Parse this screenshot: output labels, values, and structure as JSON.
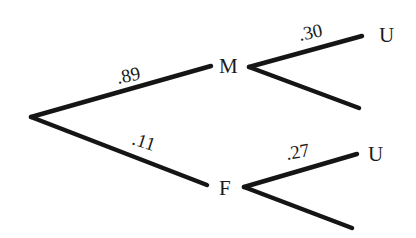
{
  "diagram": {
    "type": "probability-tree",
    "root": {
      "x": 31,
      "y": 117
    },
    "level1": [
      {
        "id": "M",
        "label": "M",
        "probability": ".89",
        "line_end": {
          "x": 211,
          "y": 66
        },
        "label_pos": {
          "x": 220,
          "y": 72
        },
        "prob_pos": {
          "x": 118,
          "y": 83,
          "rotate": -12
        },
        "children_origin": {
          "x": 249,
          "y": 67
        },
        "children": [
          {
            "label": "U",
            "probability": ".30",
            "end": {
              "x": 362,
              "y": 36
            },
            "label_pos": {
              "x": 380,
              "y": 41
            },
            "prob_pos": {
              "x": 300,
              "y": 41,
              "rotate": -12
            }
          },
          {
            "label": "",
            "probability": "",
            "end": {
              "x": 359,
              "y": 108
            }
          }
        ]
      },
      {
        "id": "F",
        "label": "F",
        "probability": ".11",
        "line_end": {
          "x": 207,
          "y": 185
        },
        "label_pos": {
          "x": 218,
          "y": 195
        },
        "prob_pos": {
          "x": 130,
          "y": 146,
          "rotate": 18
        },
        "children_origin": {
          "x": 244,
          "y": 187
        },
        "children": [
          {
            "label": "U",
            "probability": ".27",
            "end": {
              "x": 357,
              "y": 154
            },
            "label_pos": {
              "x": 369,
              "y": 160
            },
            "prob_pos": {
              "x": 288,
              "y": 160,
              "rotate": -10
            }
          },
          {
            "label": "",
            "probability": "",
            "end": {
              "x": 352,
              "y": 228
            }
          }
        ]
      }
    ]
  },
  "labels": {
    "node_m": "M",
    "node_f": "F",
    "node_m_u": "U",
    "node_f_u": "U",
    "prob_m": ".89",
    "prob_f": ".11",
    "prob_m_u": ".30",
    "prob_f_u": ".27"
  }
}
